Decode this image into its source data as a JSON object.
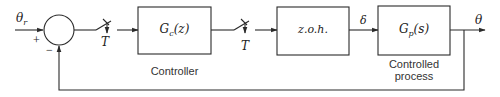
{
  "diagram": {
    "type": "block-diagram",
    "input": {
      "label": "θ",
      "subscript": "r"
    },
    "summing_junction": {
      "plus_sign": "+",
      "minus_sign": "−"
    },
    "samplers": [
      {
        "label": "T"
      },
      {
        "label": "T"
      }
    ],
    "blocks": [
      {
        "id": "controller",
        "transfer_main": "G",
        "transfer_sub": "c",
        "transfer_arg": "(z)",
        "caption_line1": "Controller",
        "caption_line2": ""
      },
      {
        "id": "zoh",
        "transfer_text": "z.o.h.",
        "caption_line1": "",
        "caption_line2": ""
      },
      {
        "id": "plant",
        "transfer_main": "G",
        "transfer_sub": "p",
        "transfer_arg": "(s)",
        "caption_line1": "Controlled",
        "caption_line2": "process"
      }
    ],
    "signals": {
      "zoh_output": "δ",
      "output": "θ"
    },
    "colors": {
      "stroke": "#2a2a2a",
      "text": "#222222",
      "background": "#ffffff"
    }
  }
}
